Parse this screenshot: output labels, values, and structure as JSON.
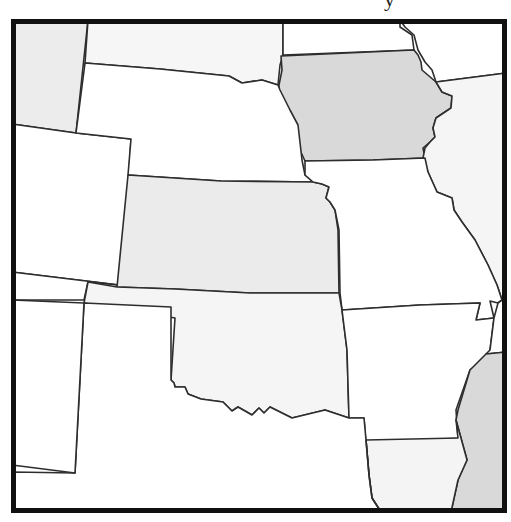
{
  "title": {
    "visible_fragment": "y"
  },
  "map": {
    "description": "Outline map of central United States with selected states shaded",
    "colors": {
      "white": "#ffffff",
      "very_light": "#f4f4f4",
      "light": "#ececec",
      "medium": "#d9d9d9",
      "border": "#2e2e2e",
      "frame": "#111111"
    },
    "states": [
      {
        "name": "Montana",
        "shade": "light"
      },
      {
        "name": "South Dakota",
        "shade": "very_light"
      },
      {
        "name": "Minnesota",
        "shade": "white"
      },
      {
        "name": "Wisconsin",
        "shade": "white"
      },
      {
        "name": "Iowa",
        "shade": "medium"
      },
      {
        "name": "Wyoming",
        "shade": "white"
      },
      {
        "name": "Nebraska",
        "shade": "white"
      },
      {
        "name": "Illinois",
        "shade": "very_light"
      },
      {
        "name": "Colorado",
        "shade": "white"
      },
      {
        "name": "Kansas",
        "shade": "light"
      },
      {
        "name": "Missouri",
        "shade": "white"
      },
      {
        "name": "New Mexico",
        "shade": "white"
      },
      {
        "name": "Oklahoma",
        "shade": "very_light"
      },
      {
        "name": "Arkansas",
        "shade": "white"
      },
      {
        "name": "Texas",
        "shade": "white"
      },
      {
        "name": "Louisiana",
        "shade": "very_light"
      },
      {
        "name": "Mississippi",
        "shade": "medium"
      },
      {
        "name": "Tennessee",
        "shade": "white"
      },
      {
        "name": "Kentucky",
        "shade": "white"
      },
      {
        "name": "Arizona",
        "shade": "white"
      }
    ]
  }
}
